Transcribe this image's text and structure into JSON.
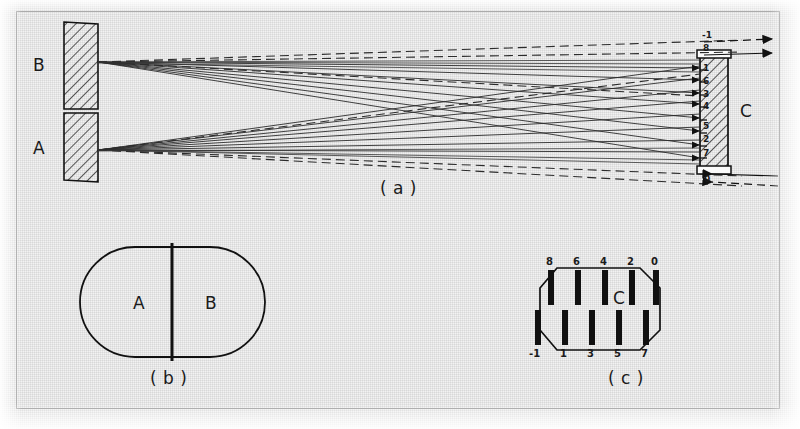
{
  "figure": {
    "panels": [
      {
        "id": "a",
        "caption": "( a )",
        "description": "ray-trace of split mirror halves A and B onto detector array C"
      },
      {
        "id": "b",
        "caption": "( b )",
        "description": "split circular mirror face, halves A and B"
      },
      {
        "id": "c",
        "caption": "( c )",
        "description": "detector array C, strip layout"
      }
    ],
    "panel_a": {
      "mirror_b_label": "B",
      "mirror_a_label": "A",
      "detector_label": "C",
      "caption": "( a )",
      "detector_strip_labels_outside_top": "-1",
      "detector_strip_labels_inside": [
        "8",
        "1",
        "6",
        "3",
        "4",
        "5",
        "2",
        "7"
      ],
      "detector_strip_labels_outside_bottom": "0",
      "top_arrow_count": 2,
      "bottom_arrow_count": 2
    },
    "panel_b": {
      "left_half_label": "A",
      "right_half_label": "B",
      "caption": "( b )"
    },
    "panel_c": {
      "center_label": "C",
      "caption": "( c )",
      "top_row_labels": [
        "8",
        "6",
        "4",
        "2",
        "0"
      ],
      "bottom_row_labels": [
        "-1",
        "1",
        "3",
        "5",
        "7"
      ]
    }
  },
  "colors": {
    "ink": "#1a1a1a",
    "frame": "#9b9b9b",
    "paper": "#f2f2f2",
    "ray": "#2a2a2a",
    "hatch": "#222222"
  }
}
